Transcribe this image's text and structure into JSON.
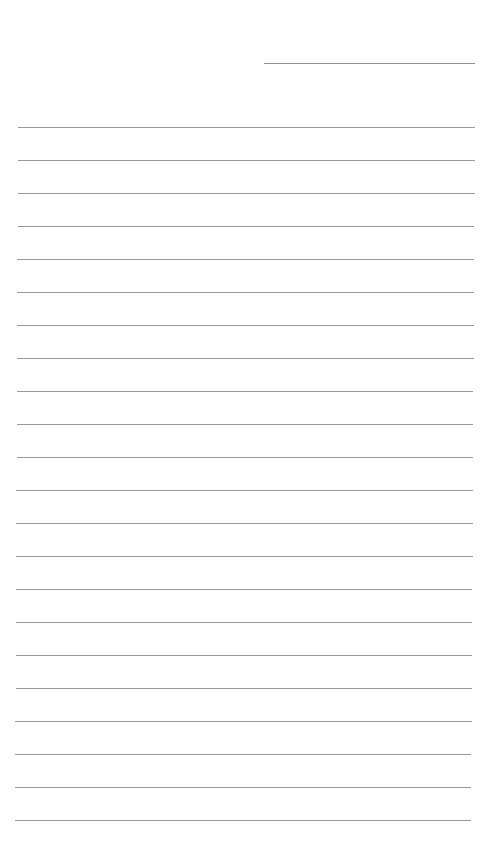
{
  "page": {
    "type": "blank ruled paper",
    "background": "#ffffff",
    "rule_color": "#9a9a9a"
  },
  "header_line": {
    "x1": 264,
    "x2": 475,
    "y": 63
  },
  "rules": {
    "count": 22,
    "first_y": 127,
    "spacing": 33,
    "x_start_top": 18,
    "x_end_top": 475,
    "x_start_bottom": 15,
    "x_end_bottom": 471
  }
}
